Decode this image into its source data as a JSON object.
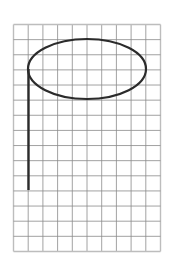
{
  "diagram": {
    "type": "grid-drawing",
    "grid": {
      "columns": 10,
      "rows": 15,
      "x0": 13.5,
      "y0": 24.5,
      "cell_w": 14.7,
      "cell_h": 15.13,
      "line_color": "#8a8a8a",
      "border_color": "#bdbdbd"
    },
    "shapes": [
      {
        "kind": "ellipse",
        "cx": 87,
        "cy": 69,
        "rx": 59,
        "ry": 30,
        "stroke": "#2b2b2b",
        "stroke_width": 2.2
      },
      {
        "kind": "line",
        "x1": 28.5,
        "y1": 69,
        "x2": 28.5,
        "y2": 190,
        "stroke": "#2b2b2b",
        "stroke_width": 2.4
      }
    ]
  }
}
